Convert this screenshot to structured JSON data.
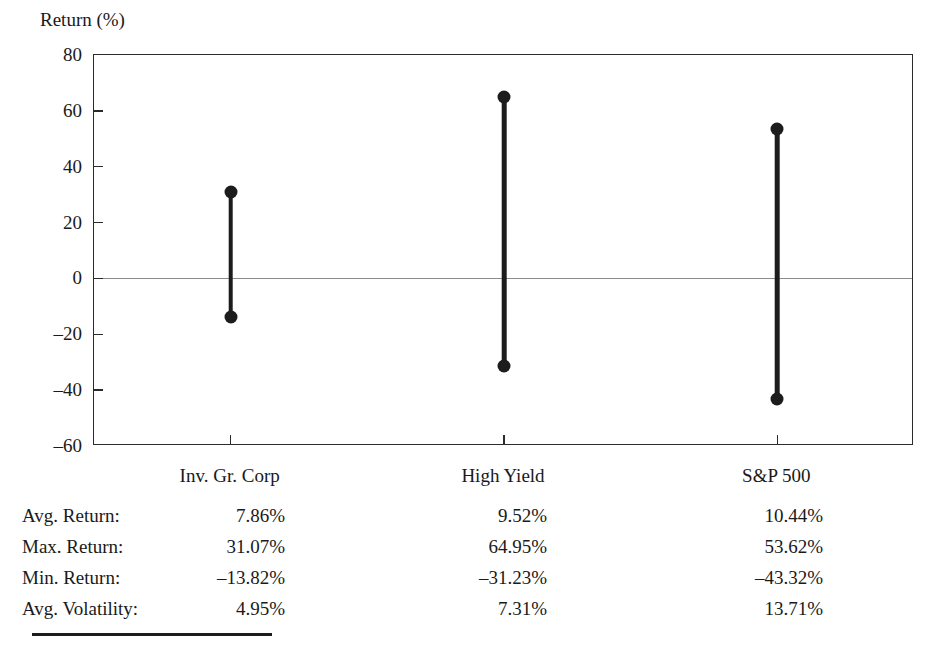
{
  "chart_data": {
    "type": "bar",
    "title": "",
    "ylabel": "Return (%)",
    "xlabel": "",
    "ylim": [
      -60,
      80
    ],
    "yticks": [
      80,
      60,
      40,
      20,
      0,
      -20,
      -40,
      -60
    ],
    "ytick_labels": [
      "80",
      "60",
      "40",
      "20",
      "0",
      "–20",
      "–40",
      "–60"
    ],
    "grid": false,
    "legend": "none",
    "zero_line": true,
    "categories": [
      "Inv. Gr. Corp",
      "High Yield",
      "S&P 500"
    ],
    "series": [
      {
        "name": "Max. Return",
        "values": [
          31.07,
          64.95,
          53.62
        ]
      },
      {
        "name": "Min. Return",
        "values": [
          -13.82,
          -31.23,
          -43.32
        ]
      }
    ],
    "points": [
      {
        "category": "Inv. Gr. Corp",
        "max": 31.07,
        "min": -13.82
      },
      {
        "category": "High Yield",
        "max": 64.95,
        "min": -31.23
      },
      {
        "category": "S&P 500",
        "max": 53.62,
        "min": -43.32
      }
    ],
    "marker": "circle",
    "colors": {
      "series": "#1c1c1c",
      "axis": "#2b2b2b",
      "zero_line": "#8b8b8b"
    }
  },
  "table": {
    "rows": [
      {
        "label": "Avg. Return:",
        "values": [
          "7.86%",
          "9.52%",
          "10.44%"
        ]
      },
      {
        "label": "Max. Return:",
        "values": [
          "31.07%",
          "64.95%",
          "53.62%"
        ]
      },
      {
        "label": "Min. Return:",
        "values": [
          "–13.82%",
          "–31.23%",
          "–43.32%"
        ]
      },
      {
        "label": "Avg. Volatility:",
        "values": [
          "4.95%",
          "7.31%",
          "13.71%"
        ]
      }
    ]
  }
}
